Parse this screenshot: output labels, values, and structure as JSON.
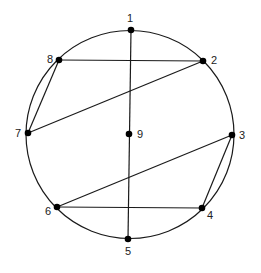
{
  "diagram": {
    "type": "graph-on-circle",
    "stroke_color": "#1a1a1a",
    "node_color": "#000000",
    "circle": {
      "cx": 130,
      "cy": 134.5,
      "r": 104
    },
    "nodes": [
      {
        "id": "1",
        "label": "1",
        "x": 131,
        "y": 30,
        "lx": 130,
        "ly": 22
      },
      {
        "id": "2",
        "label": "2",
        "x": 203,
        "y": 61,
        "lx": 214,
        "ly": 64
      },
      {
        "id": "3",
        "label": "3",
        "x": 232,
        "y": 135,
        "lx": 242,
        "ly": 139
      },
      {
        "id": "4",
        "label": "4",
        "x": 202,
        "y": 208,
        "lx": 210,
        "ly": 219
      },
      {
        "id": "5",
        "label": "5",
        "x": 128,
        "y": 239,
        "lx": 128,
        "ly": 255
      },
      {
        "id": "6",
        "label": "6",
        "x": 57,
        "y": 207,
        "lx": 48,
        "ly": 215
      },
      {
        "id": "7",
        "label": "7",
        "x": 28,
        "y": 133,
        "lx": 18,
        "ly": 137
      },
      {
        "id": "8",
        "label": "8",
        "x": 59,
        "y": 60,
        "lx": 50,
        "ly": 63
      },
      {
        "id": "9",
        "label": "9",
        "x": 129,
        "y": 134,
        "lx": 140,
        "ly": 138
      }
    ],
    "edges": [
      {
        "from": "1",
        "to": "5"
      },
      {
        "from": "8",
        "to": "2"
      },
      {
        "from": "2",
        "to": "7"
      },
      {
        "from": "7",
        "to": "8"
      },
      {
        "from": "3",
        "to": "6"
      },
      {
        "from": "6",
        "to": "4"
      },
      {
        "from": "4",
        "to": "3"
      }
    ]
  }
}
